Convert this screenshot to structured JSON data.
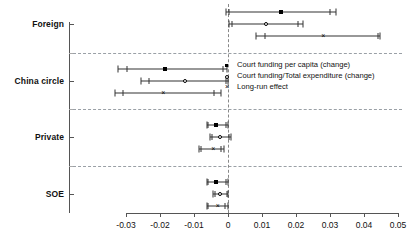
{
  "chart_data": {
    "type": "scatter",
    "title": "",
    "xlabel": "",
    "ylabel": "",
    "xlim": [
      -0.035,
      0.052
    ],
    "xticks": [
      -0.03,
      -0.02,
      -0.01,
      0,
      0.01,
      0.02,
      0.03,
      0.04,
      0.05
    ],
    "xticklabels": [
      "-0.03",
      "-0.02",
      "-0.01",
      "0",
      "0.01",
      "0.02",
      "0.03",
      "0.04",
      "0.05"
    ],
    "categories": [
      "Foreign",
      "China circle",
      "Private",
      "SOE"
    ],
    "grid": false,
    "zero_reference_line": 0,
    "legend_position": "center-right",
    "series": [
      {
        "name": "Court funding per capita (change)",
        "marker": "filled-circle",
        "estimates": [
          0.0157,
          -0.0185,
          -0.0034,
          -0.0034
        ],
        "ci_outer": [
          [
            -0.0005,
            0.0317
          ],
          [
            -0.0325,
            -0.0003
          ],
          [
            -0.0063,
            0.0001
          ],
          [
            -0.0063,
            0.0001
          ]
        ],
        "ci_inner": [
          [
            0.0003,
            0.03
          ],
          [
            -0.0297,
            -0.0015
          ],
          [
            -0.0058,
            -0.0005
          ],
          [
            -0.0058,
            -0.0005
          ]
        ]
      },
      {
        "name": "Court funding/Total expenditure (change)",
        "marker": "open-circle",
        "estimates": [
          0.0113,
          -0.0126,
          -0.0024,
          -0.0024
        ],
        "ci_outer": [
          [
            0.0002,
            0.0222
          ],
          [
            -0.0256,
            0.0
          ],
          [
            -0.0054,
            0.0009
          ],
          [
            -0.0043,
            0.0
          ]
        ],
        "ci_inner": [
          [
            0.0013,
            0.0205
          ],
          [
            -0.0231,
            -0.0007
          ],
          [
            -0.0047,
            0.0003
          ],
          [
            -0.0038,
            -0.0004
          ]
        ]
      },
      {
        "name": "Long-run effect",
        "marker": "cross",
        "estimates": [
          0.028,
          -0.019,
          -0.0043,
          -0.003
        ],
        "ci_outer": [
          [
            0.0083,
            0.0448
          ],
          [
            -0.0333,
            -0.0022
          ],
          [
            -0.0086,
            -0.0013
          ],
          [
            -0.0063,
            -0.0001
          ]
        ],
        "ci_inner": [
          [
            0.011,
            0.044
          ],
          [
            -0.031,
            -0.004
          ],
          [
            -0.008,
            -0.002
          ],
          [
            -0.0058,
            -0.0008
          ]
        ]
      }
    ]
  },
  "legend": {
    "items": [
      {
        "label": "Court funding per capita (change)",
        "marker": "filled-circle"
      },
      {
        "label": "Court funding/Total expenditure (change)",
        "marker": "open-circle"
      },
      {
        "label": "Long-run effect",
        "marker": "cross"
      }
    ]
  },
  "axis": {
    "y_labels": [
      "Foreign",
      "China circle",
      "Private",
      "SOE"
    ],
    "x_labels": [
      "-0.03",
      "-0.02",
      "-0.01",
      "0",
      "0.01",
      "0.02",
      "0.03",
      "0.04",
      "0.05"
    ]
  },
  "colors": {
    "marker": "#000000",
    "axis": "#555555",
    "separator": "#9aa0a6",
    "zero_line": "#888888",
    "background": "#ffffff"
  }
}
